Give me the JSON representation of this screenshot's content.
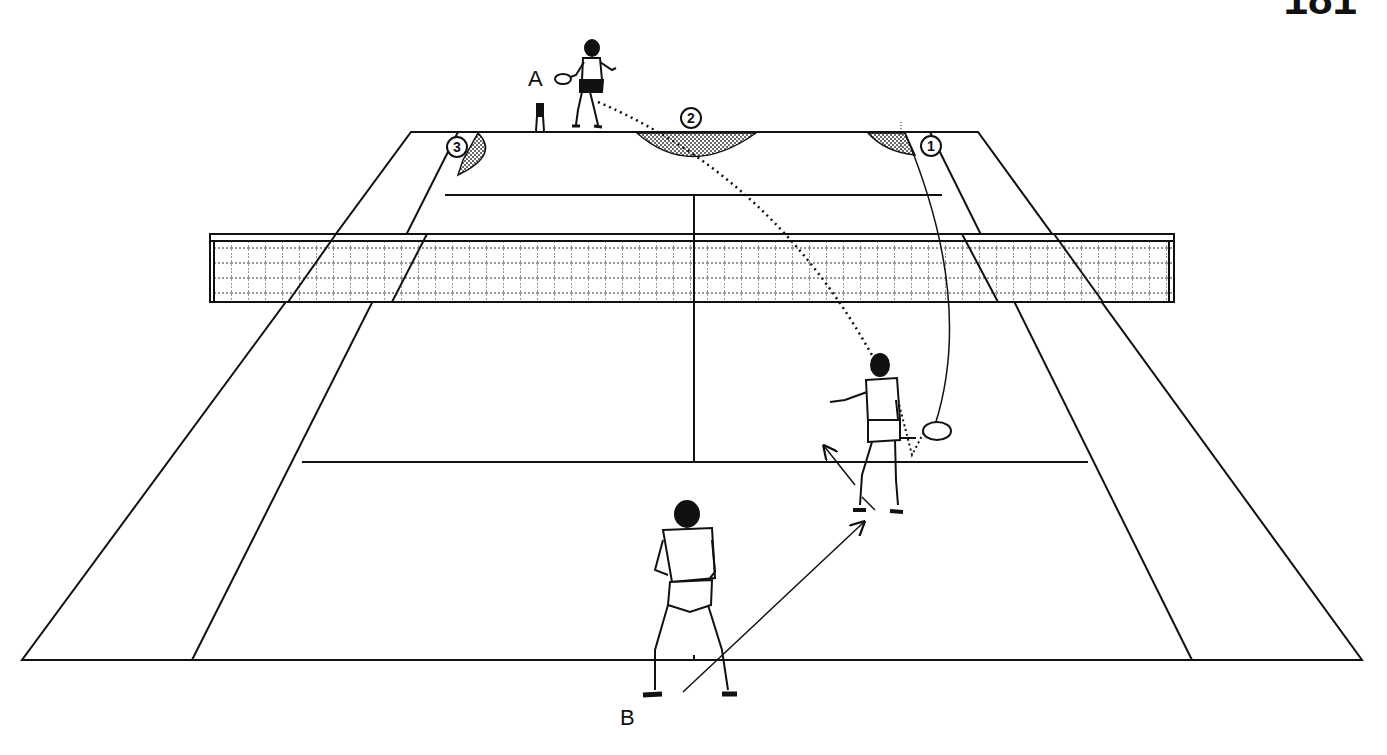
{
  "page": {
    "number": "181"
  },
  "labels": {
    "player_a": "A",
    "player_b": "B"
  },
  "targets": [
    {
      "id": 1,
      "label": "1",
      "position": "far right corner (deep cross-court)"
    },
    {
      "id": 2,
      "label": "2",
      "position": "far baseline center"
    },
    {
      "id": 3,
      "label": "3",
      "position": "far left corner"
    }
  ],
  "players": [
    {
      "id": "A",
      "position": "behind far baseline",
      "action": "forehand groundstroke"
    },
    {
      "id": "net-player",
      "position": "near court right service box",
      "action": "volley at net, moving"
    },
    {
      "id": "B",
      "position": "near baseline center",
      "action": "ready stance, moving diagonally forward-right"
    }
  ],
  "trajectories": [
    {
      "from": "A",
      "to": "net-player",
      "style": "dotted"
    },
    {
      "from": "net-player",
      "to": "target-1",
      "style": "solid"
    }
  ],
  "colors": {
    "ink": "#111111",
    "background": "#ffffff"
  }
}
